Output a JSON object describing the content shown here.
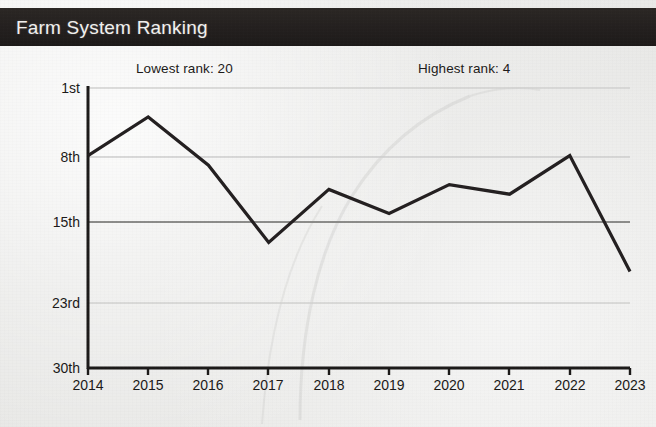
{
  "header": {
    "title": "Farm System Ranking"
  },
  "annotations": {
    "lowest": "Lowest rank: 20",
    "highest": "Highest rank: 4"
  },
  "chart_data": {
    "type": "line",
    "title": "Farm System Ranking",
    "xlabel": "",
    "ylabel": "",
    "categories": [
      "2014",
      "2015",
      "2016",
      "2017",
      "2018",
      "2019",
      "2020",
      "2021",
      "2022",
      "2023"
    ],
    "values": [
      8,
      4,
      9,
      17,
      11.5,
      14,
      11,
      12,
      8,
      20
    ],
    "series": [
      {
        "name": "Farm System Ranking",
        "values": [
          8,
          4,
          9,
          17,
          11.5,
          14,
          11,
          12,
          8,
          20
        ]
      }
    ],
    "ylim": [
      1,
      30
    ],
    "y_inverted": true,
    "ytick_values": [
      1,
      8,
      15,
      23,
      30
    ],
    "ytick_labels": [
      "1st",
      "8th",
      "15th",
      "23rd",
      "30th"
    ],
    "xtick_labels": [
      "2014",
      "2015",
      "2016",
      "2017",
      "2018",
      "2019",
      "2020",
      "2021",
      "2022",
      "2023"
    ],
    "grid": true,
    "gridlines_at": [
      1,
      8,
      15,
      23
    ],
    "emphasized_gridline": 15,
    "legend": "none",
    "annotations": [
      {
        "text": "Lowest rank: 20",
        "value": 20
      },
      {
        "text": "Highest rank: 4",
        "value": 4
      }
    ],
    "line_color": "#231f20",
    "line_width": 3.2,
    "background_color": "#ebebe9"
  },
  "colors": {
    "header_bg": "#231f20",
    "header_text": "#f2f1ef",
    "line": "#231f20",
    "grid_light": "#cfcfcd",
    "grid_dark": "#8b8b89",
    "axis": "#1b1918",
    "page_bg": "#ebebe9"
  }
}
